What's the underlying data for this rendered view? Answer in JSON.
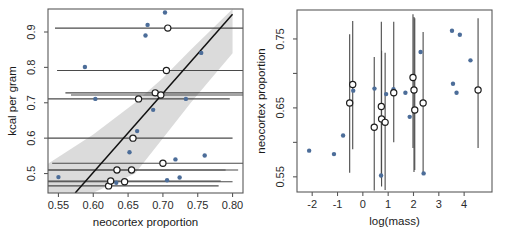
{
  "figure": {
    "background": "#ffffff",
    "point_color": "#4c6d99",
    "band_color": "#d5d5d5",
    "line_color": "#111111",
    "axis_color": "#595959"
  },
  "chart_data": [
    {
      "type": "scatter",
      "panel": "left",
      "title": "",
      "xlabel": "neocortex proportion",
      "ylabel": "kcal per gram",
      "xlim": [
        0.535,
        0.815
      ],
      "ylim": [
        0.445,
        0.965
      ],
      "xticks": [
        0.55,
        0.6,
        0.65,
        0.7,
        0.75,
        0.8
      ],
      "xticklabels": [
        "0.55",
        "0.60",
        "0.65",
        "0.70",
        "0.75",
        "0.80"
      ],
      "yticks": [
        0.5,
        0.6,
        0.7,
        0.8,
        0.9
      ],
      "yticklabels": [
        "0.5",
        "0.6",
        "0.7",
        "0.8",
        "0.9"
      ],
      "grid": false,
      "legend": "none",
      "points_observed": [
        {
          "x": 0.55,
          "y": 0.49
        },
        {
          "x": 0.588,
          "y": 0.801
        },
        {
          "x": 0.603,
          "y": 0.711
        },
        {
          "x": 0.623,
          "y": 0.465
        },
        {
          "x": 0.627,
          "y": 0.479
        },
        {
          "x": 0.633,
          "y": 0.474
        },
        {
          "x": 0.645,
          "y": 0.473
        },
        {
          "x": 0.652,
          "y": 0.56
        },
        {
          "x": 0.655,
          "y": 0.6
        },
        {
          "x": 0.663,
          "y": 0.62
        },
        {
          "x": 0.675,
          "y": 0.89
        },
        {
          "x": 0.678,
          "y": 0.92
        },
        {
          "x": 0.686,
          "y": 0.68
        },
        {
          "x": 0.69,
          "y": 0.728
        },
        {
          "x": 0.695,
          "y": 0.722
        },
        {
          "x": 0.703,
          "y": 0.955
        },
        {
          "x": 0.706,
          "y": 0.481
        },
        {
          "x": 0.718,
          "y": 0.54
        },
        {
          "x": 0.724,
          "y": 0.489
        },
        {
          "x": 0.733,
          "y": 0.711
        },
        {
          "x": 0.755,
          "y": 0.841
        },
        {
          "x": 0.76,
          "y": 0.551
        }
      ],
      "points_imputed": [
        {
          "x": 0.622,
          "y": 0.465,
          "xlo": 0.468,
          "xhi": 0.78
        },
        {
          "x": 0.625,
          "y": 0.479,
          "xlo": 0.47,
          "xhi": 0.783
        },
        {
          "x": 0.634,
          "y": 0.51,
          "xlo": 0.478,
          "xhi": 0.79
        },
        {
          "x": 0.645,
          "y": 0.477,
          "xlo": 0.487,
          "xhi": 0.8
        },
        {
          "x": 0.655,
          "y": 0.51,
          "xlo": 0.496,
          "xhi": 0.808
        },
        {
          "x": 0.657,
          "y": 0.6,
          "xlo": 0.512,
          "xhi": 0.8
        },
        {
          "x": 0.665,
          "y": 0.711,
          "xlo": 0.535,
          "xhi": 0.796
        },
        {
          "x": 0.689,
          "y": 0.728,
          "xlo": 0.56,
          "xhi": 0.818
        },
        {
          "x": 0.697,
          "y": 0.722,
          "xlo": 0.568,
          "xhi": 0.826
        },
        {
          "x": 0.7,
          "y": 0.529,
          "xlo": 0.541,
          "xhi": 0.857
        },
        {
          "x": 0.705,
          "y": 0.791,
          "xlo": 0.548,
          "xhi": 0.864
        },
        {
          "x": 0.707,
          "y": 0.911,
          "xlo": 0.545,
          "xhi": 0.87
        }
      ],
      "regression_line": {
        "x1": 0.574,
        "y1": 0.445,
        "x2": 0.8,
        "y2": 0.95
      },
      "ci_band": {
        "x": [
          0.535,
          0.6,
          0.66,
          0.7,
          0.74,
          0.8
        ],
        "lower": [
          0.445,
          0.446,
          0.5,
          0.6,
          0.7,
          0.84
        ],
        "upper": [
          0.528,
          0.61,
          0.7,
          0.77,
          0.85,
          0.965
        ]
      }
    },
    {
      "type": "scatter",
      "panel": "right",
      "title": "",
      "xlabel": "log(mass)",
      "ylabel": "neocortex proportion",
      "xlim": [
        -2.6,
        5.1
      ],
      "ylim": [
        0.528,
        0.792
      ],
      "xticks": [
        -2,
        -1,
        0,
        1,
        2,
        3,
        4
      ],
      "xticklabels": [
        "-2",
        "-1",
        "0",
        "1",
        "2",
        "3",
        "4"
      ],
      "yticks": [
        0.55,
        0.65,
        0.75
      ],
      "yticklabels": [
        "0.55",
        "0.65",
        "0.75"
      ],
      "yminorticks": [
        0.6,
        0.7
      ],
      "grid": false,
      "legend": "none",
      "points_observed": [
        {
          "x": -2.12,
          "y": 0.588
        },
        {
          "x": -1.14,
          "y": 0.583
        },
        {
          "x": -0.78,
          "y": 0.61
        },
        {
          "x": -0.38,
          "y": 0.675
        },
        {
          "x": 0.46,
          "y": 0.678
        },
        {
          "x": 0.72,
          "y": 0.552
        },
        {
          "x": 0.92,
          "y": 0.67
        },
        {
          "x": 1.21,
          "y": 0.677
        },
        {
          "x": 1.68,
          "y": 0.672
        },
        {
          "x": 1.85,
          "y": 0.637
        },
        {
          "x": 2.28,
          "y": 0.731
        },
        {
          "x": 2.4,
          "y": 0.555
        },
        {
          "x": 3.52,
          "y": 0.762
        },
        {
          "x": 3.56,
          "y": 0.685
        },
        {
          "x": 3.7,
          "y": 0.672
        },
        {
          "x": 3.83,
          "y": 0.756
        },
        {
          "x": 4.25,
          "y": 0.719
        }
      ],
      "points_imputed": [
        {
          "x": -0.4,
          "y": 0.684,
          "ylo": 0.59,
          "yhi": 0.776
        },
        {
          "x": -0.52,
          "y": 0.657,
          "ylo": 0.556,
          "yhi": 0.757
        },
        {
          "x": 0.45,
          "y": 0.622,
          "ylo": 0.53,
          "yhi": 0.724
        },
        {
          "x": 0.73,
          "y": 0.652,
          "ylo": 0.548,
          "yhi": 0.775
        },
        {
          "x": 0.74,
          "y": 0.634,
          "ylo": 0.536,
          "yhi": 0.733
        },
        {
          "x": 0.88,
          "y": 0.629,
          "ylo": 0.531,
          "yhi": 0.73
        },
        {
          "x": 1.22,
          "y": 0.672,
          "ylo": 0.6,
          "yhi": 0.775
        },
        {
          "x": 1.98,
          "y": 0.694,
          "ylo": 0.592,
          "yhi": 0.786
        },
        {
          "x": 2.02,
          "y": 0.676,
          "ylo": 0.557,
          "yhi": 0.782
        },
        {
          "x": 2.05,
          "y": 0.647,
          "ylo": 0.56,
          "yhi": 0.78
        },
        {
          "x": 2.38,
          "y": 0.657,
          "ylo": 0.556,
          "yhi": 0.76
        },
        {
          "x": 4.55,
          "y": 0.676,
          "ylo": 0.592,
          "yhi": 0.78
        }
      ]
    }
  ]
}
